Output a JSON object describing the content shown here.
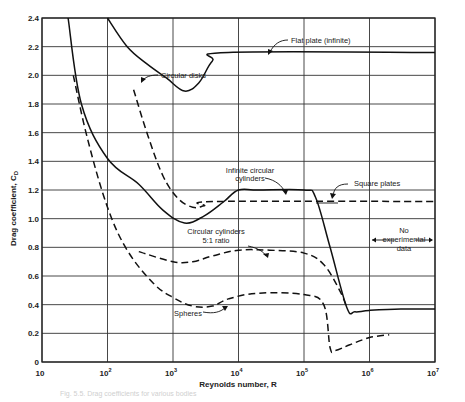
{
  "chart_data": {
    "type": "line",
    "title": "",
    "xlabel": "Reynolds number, R",
    "ylabel": "Drag coefficient, C_D",
    "xscale": "log",
    "xlim": [
      10,
      10000000
    ],
    "ylim": [
      0,
      2.4
    ],
    "grid": true,
    "x_ticks": [
      "10",
      "10²",
      "10³",
      "10⁴",
      "10⁵",
      "10⁶",
      "10⁷"
    ],
    "y_ticks": [
      "0",
      "0.2",
      "0.4",
      "0.6",
      "0.8",
      "1.0",
      "1.2",
      "1.4",
      "1.6",
      "1.8",
      "2.0",
      "2.2",
      "2.4"
    ],
    "series": [
      {
        "name": "Flat plate (infinite)",
        "style": "solid",
        "x": [
          100,
          200,
          400,
          800,
          1500,
          2500,
          4000,
          7000,
          10000000
        ],
        "y": [
          2.4,
          2.2,
          2.08,
          1.98,
          1.89,
          1.95,
          2.1,
          2.16,
          2.16
        ]
      },
      {
        "name": "Circular disks",
        "style": "dashed",
        "x": [
          250,
          400,
          700,
          1200,
          2000,
          3000,
          5000,
          10000000
        ],
        "y": [
          1.9,
          1.6,
          1.3,
          1.14,
          1.08,
          1.09,
          1.12,
          1.12
        ]
      },
      {
        "name": "Infinite circular cylinders",
        "style": "solid",
        "x": [
          25,
          40,
          100,
          300,
          700,
          1500,
          3000,
          6000,
          10000,
          20000,
          100000,
          150000,
          250000,
          450000,
          600000,
          1000000,
          3000000,
          10000000
        ],
        "y": [
          2.4,
          1.8,
          1.42,
          1.24,
          1.06,
          0.97,
          1.02,
          1.12,
          1.2,
          1.2,
          1.2,
          1.15,
          0.8,
          0.38,
          0.35,
          0.36,
          0.37,
          0.37
        ]
      },
      {
        "name": "Square plates",
        "style": "solid-marker",
        "x": [
          100000,
          200000
        ],
        "y": [
          1.14,
          1.14
        ]
      },
      {
        "name": "Circular cylinders 5:1 ratio",
        "style": "dashed",
        "x": [
          300,
          1000,
          2000,
          4000,
          10000,
          30000,
          100000,
          200000,
          350000,
          450000
        ],
        "y": [
          0.77,
          0.7,
          0.7,
          0.74,
          0.78,
          0.78,
          0.76,
          0.68,
          0.5,
          0.38
        ]
      },
      {
        "name": "Spheres",
        "style": "dashed",
        "x": [
          30,
          50,
          100,
          200,
          500,
          1000,
          2000,
          4000,
          7000,
          20000,
          100000,
          200000,
          250000,
          300000,
          500000,
          1000000,
          2000000
        ],
        "y": [
          2.0,
          1.55,
          1.08,
          0.78,
          0.55,
          0.45,
          0.39,
          0.39,
          0.44,
          0.48,
          0.47,
          0.4,
          0.1,
          0.08,
          0.12,
          0.17,
          0.19
        ]
      }
    ],
    "annotations": [
      "Flat plate (infinite)",
      "Circular disks",
      "Infinite circular cylinders",
      "Square plates",
      "Circular cylinders 5:1 ratio",
      "Spheres",
      "No experimental data"
    ]
  },
  "labels": {
    "flat_plate": "Flat plate (infinite)",
    "circular_disks": "Circular disks",
    "infinite_cyl_1": "Infinite circular",
    "infinite_cyl_2": "cylinders",
    "square_plates": "Square plates",
    "cyl51_1": "Circular cylinders",
    "cyl51_2": "5:1 ratio",
    "spheres": "Spheres",
    "noexp_1": "No",
    "noexp_2": "experimental",
    "noexp_3": "data"
  },
  "axes": {
    "ylabel": "Drag coefficient, C",
    "ylabel_sub": "D",
    "xlabel": "Reynolds number, R",
    "y_ticks": [
      "0",
      "0.2",
      "0.4",
      "0.6",
      "0.8",
      "1.0",
      "1.2",
      "1.4",
      "1.6",
      "1.8",
      "2.0",
      "2.2",
      "2.4"
    ],
    "x_ticks": [
      "10",
      "10",
      "10",
      "10",
      "10",
      "10",
      "10"
    ],
    "x_exps": [
      "",
      "2",
      "3",
      "4",
      "5",
      "6",
      "7"
    ]
  },
  "caption": "Fig. 5.5. Drag coefficients for various bodies"
}
